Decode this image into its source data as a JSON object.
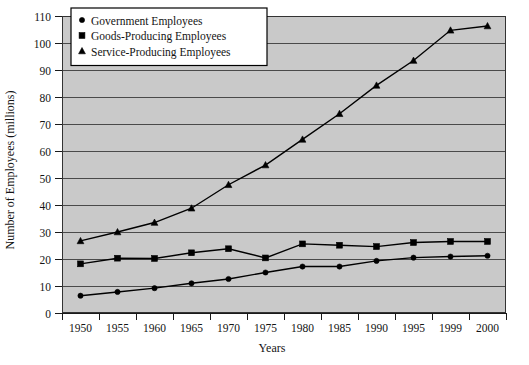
{
  "chart_data": {
    "type": "line",
    "title": "",
    "xlabel": "Years",
    "ylabel": "Number of Employees (millions)",
    "categories": [
      "1950",
      "1955",
      "1960",
      "1965",
      "1970",
      "1975",
      "1980",
      "1985",
      "1990",
      "1995",
      "1999",
      "2000"
    ],
    "ylim": [
      0,
      110
    ],
    "ytick_step": 10,
    "yticks": [
      "0",
      "10",
      "20",
      "30",
      "40",
      "50",
      "60",
      "70",
      "80",
      "90",
      "100",
      "110"
    ],
    "grid": true,
    "grid_axis": "y",
    "legend_position": "top-left",
    "plot_background": "#c9c9c9",
    "series": [
      {
        "name": "Government Employees",
        "marker": "circle",
        "color": "#000000",
        "values": [
          6.4,
          7.8,
          9.2,
          11.0,
          12.6,
          15.0,
          17.2,
          17.2,
          19.3,
          20.5,
          20.9,
          21.2
        ]
      },
      {
        "name": "Goods-Producing Employees",
        "marker": "square",
        "color": "#000000",
        "values": [
          18.2,
          20.3,
          20.2,
          22.3,
          23.8,
          20.4,
          25.6,
          25.1,
          24.6,
          26.1,
          26.5,
          26.5
        ]
      },
      {
        "name": "Service-Producing Employees",
        "marker": "triangle",
        "color": "#000000",
        "values": [
          26.7,
          30.0,
          33.5,
          38.8,
          47.5,
          54.8,
          64.3,
          73.8,
          84.3,
          93.5,
          104.7,
          106.3
        ]
      }
    ]
  },
  "legend": {
    "items": [
      {
        "label": "Government Employees",
        "marker": "circle"
      },
      {
        "label": "Goods-Producing Employees",
        "marker": "square"
      },
      {
        "label": "Service-Producing Employees",
        "marker": "triangle"
      }
    ]
  },
  "axes": {
    "x_title": "Years",
    "y_title": "Number of Employees (millions)"
  }
}
